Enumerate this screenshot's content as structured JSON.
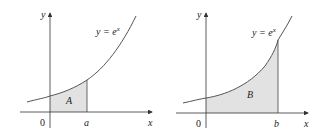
{
  "colors": {
    "axis": "#333333",
    "curve": "#555555",
    "fill": "#e2e2e2",
    "text": "#222222"
  },
  "panels": [
    {
      "curve_label_y": "y = e",
      "curve_label_sup": "x",
      "axis_x_label": "x",
      "axis_y_label": "y",
      "origin_label": "0",
      "bound_label": "a",
      "region_label": "A"
    },
    {
      "curve_label_y": "y = e",
      "curve_label_sup": "x",
      "axis_x_label": "x",
      "axis_y_label": "y",
      "origin_label": "0",
      "bound_label": "b",
      "region_label": "B"
    }
  ]
}
